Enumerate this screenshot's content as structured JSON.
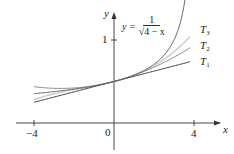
{
  "chart_data": {
    "type": "line",
    "title": "",
    "xlabel": "x",
    "ylabel": "y",
    "xlim": [
      -4.4,
      4.4
    ],
    "ylim": [
      -0.3,
      1.45
    ],
    "grid": false,
    "x_ticks": [
      {
        "value": -4,
        "label": "−4"
      },
      {
        "value": 0,
        "label": "0"
      },
      {
        "value": 4,
        "label": "4"
      }
    ],
    "y_ticks": [
      {
        "value": 1,
        "label": "1"
      }
    ],
    "series": [
      {
        "name": "y = 1/√(4 − x)",
        "expr": "1/sqrt(4-x)",
        "x_range": [
          -4,
          3.55
        ],
        "color": "#6a6a6a"
      },
      {
        "name": "T1",
        "expr": "1/2 + x/16",
        "x_range": [
          -4,
          3.8
        ],
        "color": "#444444"
      },
      {
        "name": "T2",
        "expr": "1/2 + x/16 + 3x^2/256",
        "x_range": [
          -4,
          3.8
        ],
        "color": "#8a8a8a"
      },
      {
        "name": "T3",
        "expr": "1/2 + x/16 + 3x^2/256 + 5x^3/2048",
        "x_range": [
          -4,
          3.8
        ],
        "color": "#cfcfcf"
      }
    ],
    "annotations": [
      {
        "text": "y = 1/√(4 − x)",
        "near": "upper curve"
      },
      {
        "text": "T3",
        "x": 4,
        "y": 1.21
      },
      {
        "text": "T2",
        "x": 4,
        "y": 0.93
      },
      {
        "text": "T1",
        "x": 4,
        "y": 0.75
      }
    ],
    "legend_position": "inline labels right"
  },
  "labels": {
    "x_axis": "x",
    "y_axis": "y",
    "tick_neg4": "−4",
    "tick_0": "0",
    "tick_4": "4",
    "tick_y1": "1",
    "eq_lhs": "y =",
    "eq_num": "1",
    "eq_den": "√4 − x",
    "t1": "T",
    "t1_sub": "1",
    "t2": "T",
    "t2_sub": "2",
    "t3": "T",
    "t3_sub": "3"
  }
}
